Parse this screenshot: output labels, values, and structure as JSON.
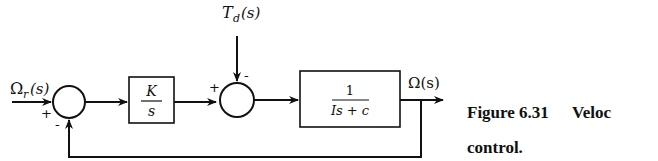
{
  "diagram": {
    "type": "block-diagram",
    "input_label": "Ω",
    "input_sub": "r",
    "input_arg": "(s)",
    "disturbance_label": "T",
    "disturbance_sub": "d",
    "disturbance_arg": "(s)",
    "output_label": "Ω(s)",
    "sum1": {
      "plus": "+",
      "minus": "-"
    },
    "sum2": {
      "plus": "+",
      "minus": "-"
    },
    "controller": {
      "numerator": "K",
      "denominator": "s"
    },
    "plant": {
      "numerator": "1",
      "denominator": "Is + c"
    }
  },
  "caption": {
    "figure": "Figure 6.31",
    "title_part1": "Veloc",
    "title_part2": "control."
  }
}
